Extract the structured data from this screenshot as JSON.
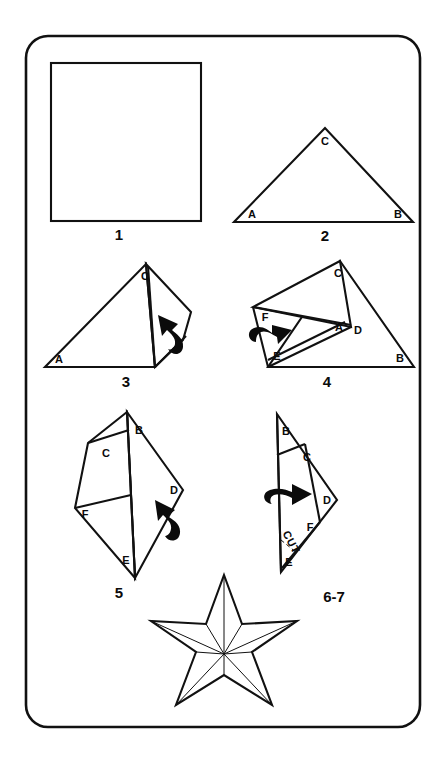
{
  "page": {
    "background_color": "#ffffff",
    "ink_color": "#111111",
    "border_shape": "rounded-rectangle"
  },
  "steps": [
    {
      "number": "1",
      "name": "square-sheet",
      "description": "Start with a square sheet of paper.",
      "vertex_labels": [],
      "arrow": null
    },
    {
      "number": "2",
      "name": "folded-triangle",
      "description": "Fold the square in half diagonally to form a triangle.",
      "vertex_labels": [
        "A",
        "B",
        "C"
      ],
      "arrow": null
    },
    {
      "number": "3",
      "name": "first-flap-fold",
      "description": "Fold the right portion over; a flap extends to the right.",
      "vertex_labels": [
        "A",
        "C"
      ],
      "arrow": "curved-fold-up-left"
    },
    {
      "number": "4",
      "name": "second-flap-fold",
      "description": "Fold again creating points D, E and F.",
      "vertex_labels": [
        "C",
        "F",
        "A",
        "D",
        "E",
        "B"
      ],
      "arrow": "curved-fold-right"
    },
    {
      "number": "5",
      "name": "kite-shape",
      "description": "The paper now forms a narrow kite shape.",
      "vertex_labels": [
        "B",
        "C",
        "F",
        "D",
        "E"
      ],
      "arrow": "curved-fold-up"
    },
    {
      "number": "6-7",
      "name": "cut-step",
      "description": "Fold once more, then cut along the indicated line.",
      "vertex_labels": [
        "B",
        "C",
        "D",
        "F",
        "E"
      ],
      "arrow": "curved-fold-right",
      "annotation": "CUT"
    },
    {
      "number": "",
      "name": "finished-star",
      "description": "Unfold to reveal the finished five-pointed star.",
      "vertex_labels": [],
      "arrow": null
    }
  ],
  "labels": {
    "step1": "1",
    "step2": "2",
    "step3": "3",
    "step4": "4",
    "step5": "5",
    "step67": "6-7",
    "cut": "CUT",
    "A": "A",
    "B": "B",
    "C": "C",
    "D": "D",
    "E": "E",
    "F": "F"
  },
  "star": {
    "points": 5,
    "center_x": 224,
    "center_y": 654,
    "outer_radius": 79,
    "inner_radius": 31,
    "fold_lines": "radial creases from center to each outer point and each inner vertex"
  }
}
